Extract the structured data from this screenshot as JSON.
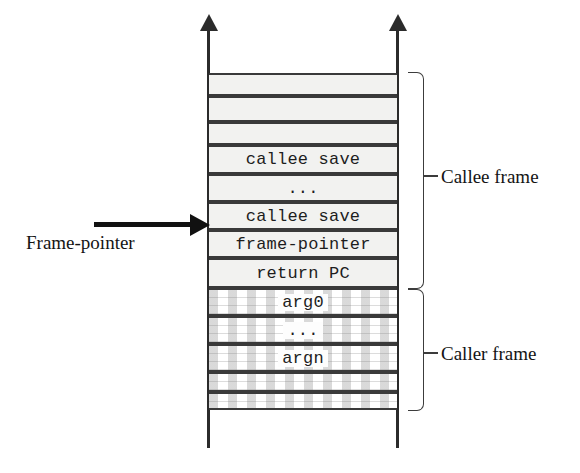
{
  "diagram": {
    "stack": {
      "cells": [
        {
          "id": "callee-pad-1",
          "label": "",
          "region": "callee",
          "top": 73,
          "height": 23,
          "style": "solid"
        },
        {
          "id": "callee-pad-2",
          "label": "",
          "region": "callee",
          "top": 96,
          "height": 26,
          "style": "solid"
        },
        {
          "id": "callee-pad-3",
          "label": "",
          "region": "callee",
          "top": 122,
          "height": 23,
          "style": "solid"
        },
        {
          "id": "callee-save-top",
          "label": "callee save",
          "region": "callee",
          "top": 145,
          "height": 29,
          "style": "solid"
        },
        {
          "id": "callee-save-ellipsis",
          "label": "...",
          "region": "callee",
          "top": 174,
          "height": 28,
          "style": "solid"
        },
        {
          "id": "callee-save-bottom",
          "label": "callee save",
          "region": "callee",
          "top": 202,
          "height": 28,
          "style": "solid"
        },
        {
          "id": "frame-pointer-slot",
          "label": "frame-pointer",
          "region": "callee",
          "top": 230,
          "height": 28,
          "style": "solid"
        },
        {
          "id": "return-pc-slot",
          "label": "return PC",
          "region": "callee",
          "top": 258,
          "height": 30,
          "style": "solid"
        },
        {
          "id": "arg0-slot",
          "label": "arg0",
          "region": "caller",
          "top": 288,
          "height": 28,
          "style": "hatched"
        },
        {
          "id": "arg-ellipsis",
          "label": "...",
          "region": "caller",
          "top": 316,
          "height": 28,
          "style": "hatched"
        },
        {
          "id": "argn-slot",
          "label": "argn",
          "region": "caller",
          "top": 344,
          "height": 28,
          "style": "hatched"
        },
        {
          "id": "caller-pad-1",
          "label": "",
          "region": "caller",
          "top": 372,
          "height": 20,
          "style": "hatched"
        },
        {
          "id": "caller-pad-2",
          "label": "",
          "region": "caller",
          "top": 392,
          "height": 18,
          "style": "hatched"
        }
      ]
    },
    "pointer": {
      "label": "Frame-pointer",
      "target_cell": "frame-pointer-slot"
    },
    "brackets": [
      {
        "id": "callee-bracket",
        "label": "Callee frame",
        "top": 72,
        "height": 217,
        "tick_y": 175,
        "label_y": 166
      },
      {
        "id": "caller-bracket",
        "label": "Caller frame",
        "top": 289,
        "height": 122,
        "tick_y": 352,
        "label_y": 343
      }
    ],
    "rails": {
      "left_label": "stack-rail-left",
      "right_label": "stack-rail-right",
      "direction": "up"
    },
    "colors": {
      "line": "#2b2b2b",
      "cell_fill": "#f2f2f0",
      "text": "#1d1d1d",
      "background": "#ffffff"
    }
  }
}
